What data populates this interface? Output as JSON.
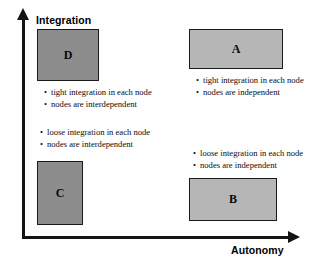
{
  "diagram": {
    "type": "2x2-quadrant-matrix",
    "axes": {
      "y": {
        "label": "Integration",
        "icon": "arrow-up-icon"
      },
      "x": {
        "label": "Autonomy",
        "icon": "arrow-right-icon"
      }
    },
    "colors": {
      "box_dark_fill": "#8d8d8d",
      "box_light_fill": "#b6b6b6",
      "border": "#1a1a1a",
      "text": "#0d0d0d",
      "background": "#fefefe"
    },
    "quadrants": [
      {
        "id": "D",
        "label": "D",
        "position": "top-left",
        "integration": "tight",
        "autonomy": "low",
        "fill": "#8d8d8d",
        "bullets": [
          "tight integration in each node",
          "nodes are interdependent"
        ]
      },
      {
        "id": "A",
        "label": "A",
        "position": "top-right",
        "integration": "tight",
        "autonomy": "high",
        "fill": "#b6b6b6",
        "bullets": [
          "tight integration in each node",
          "nodes are independent"
        ]
      },
      {
        "id": "C",
        "label": "C",
        "position": "bottom-left",
        "integration": "loose",
        "autonomy": "low",
        "fill": "#8d8d8d",
        "bullets": [
          "loose integration in each node",
          "nodes are interdependent"
        ]
      },
      {
        "id": "B",
        "label": "B",
        "position": "bottom-right",
        "integration": "loose",
        "autonomy": "high",
        "fill": "#b6b6b6",
        "bullets": [
          "loose integration in each node",
          "nodes are independent"
        ]
      }
    ]
  }
}
